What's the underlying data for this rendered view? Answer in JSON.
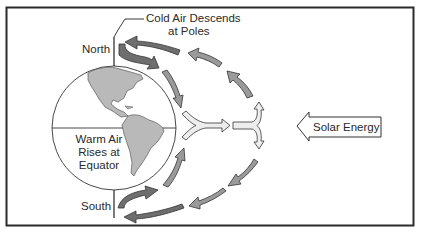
{
  "diagram": {
    "title_cutoff": "",
    "labels": {
      "cold_air_line1": "Cold Air Descends",
      "cold_air_line2": "at Poles",
      "north": "North",
      "south": "South",
      "warm_air_line1": "Warm Air",
      "warm_air_line2": "Rises at",
      "warm_air_line3": "Equator",
      "solar_energy": "Solar Energy"
    },
    "colors": {
      "frame": "#2b2b2b",
      "land": "#b9b9b9",
      "arrow_dark": "#6e6e6e",
      "arrow_mid": "#9a9a9a",
      "arrow_light": "#ededed",
      "outline": "#333333"
    }
  }
}
